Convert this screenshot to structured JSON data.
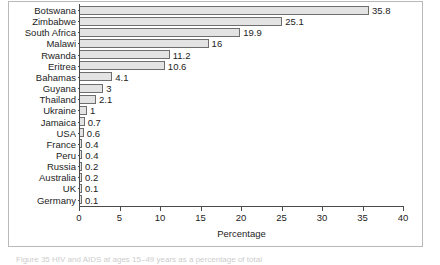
{
  "figure": {
    "caption": "Figure 35  HIV and AIDS at ages 15–49 years as a percentage of total"
  },
  "chart_data": {
    "type": "bar",
    "orientation": "horizontal",
    "title": "",
    "xlabel": "Percentage",
    "ylabel": "",
    "xlim": [
      0,
      40
    ],
    "xticks": [
      "0",
      "5",
      "10",
      "15",
      "20",
      "25",
      "30",
      "35",
      "40"
    ],
    "xtick_values": [
      0,
      5,
      10,
      15,
      20,
      25,
      30,
      35,
      40
    ],
    "grid": false,
    "legend": null,
    "bar_color": "#e3e3e3",
    "bar_edge_color": "#6e6e6e",
    "categories": [
      "Botswana",
      "Zimbabwe",
      "South Africa",
      "Malawi",
      "Rwanda",
      "Eritrea",
      "Bahamas",
      "Guyana",
      "Thailand",
      "Ukraine",
      "Jamaica",
      "USA",
      "France",
      "Peru",
      "Russia",
      "Australia",
      "UK",
      "Germany"
    ],
    "values": [
      35.8,
      25.1,
      19.9,
      16,
      11.2,
      10.6,
      4.1,
      3,
      2.1,
      1,
      0.7,
      0.6,
      0.4,
      0.4,
      0.2,
      0.2,
      0.1,
      0.1
    ],
    "value_labels": [
      "35.8",
      "25.1",
      "19.9",
      "16",
      "11.2",
      "10.6",
      "4.1",
      "3",
      "2.1",
      "1",
      "0.7",
      "0.6",
      "0.4",
      "0.4",
      "0.2",
      "0.2",
      "0.1",
      "0.1"
    ]
  }
}
